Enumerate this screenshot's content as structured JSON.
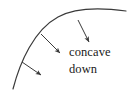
{
  "figure": {
    "kind": "concavity-diagram",
    "background_color": "#ffffff",
    "ink_color": "#3a3a3a",
    "text_color": "#1a1a1a",
    "caption_lines": [
      "concave",
      "down"
    ],
    "curve": {
      "name": "concave-down-curve",
      "description": "arc rising steeply from lower left, flattening toward the right",
      "path": "M 13,89 C 20,62 34,30 58,17 C 76,7 104,8 126,11",
      "stroke_width": 1.2
    },
    "arrows": [
      {
        "name": "tangent-arrow-lower-left",
        "from": [
          22,
          62
        ],
        "to": [
          41,
          75
        ]
      },
      {
        "name": "tangent-arrow-middle",
        "from": [
          41,
          34
        ],
        "to": [
          60,
          53
        ]
      },
      {
        "name": "tangent-arrow-upper-right",
        "from": [
          78,
          20
        ],
        "to": [
          89,
          42
        ]
      }
    ]
  }
}
